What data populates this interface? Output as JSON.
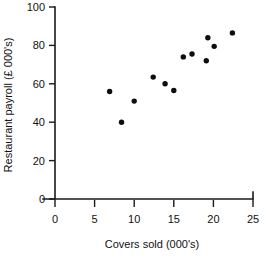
{
  "chart_data": {
    "type": "scatter",
    "title": "",
    "xlabel": "Covers sold (000's)",
    "ylabel": "Restaurant payroll (£ 000's)",
    "xlim": [
      0,
      25
    ],
    "ylim": [
      0,
      100
    ],
    "xticks": [
      0,
      5,
      10,
      15,
      20,
      25
    ],
    "yticks": [
      0,
      20,
      40,
      60,
      80,
      100
    ],
    "xtick_labels": [
      "0",
      "5",
      "10",
      "15",
      "20",
      "25"
    ],
    "ytick_labels": [
      "0",
      "20",
      "40",
      "60",
      "80",
      "100"
    ],
    "grid": false,
    "legend": false,
    "marker_color": "#0d0d0d",
    "axis_color": "#1a1a1a",
    "series": [
      {
        "name": "Restaurants",
        "points": [
          {
            "x": 6.9,
            "y": 56
          },
          {
            "x": 8.4,
            "y": 40
          },
          {
            "x": 10.0,
            "y": 51
          },
          {
            "x": 12.4,
            "y": 63.5
          },
          {
            "x": 13.9,
            "y": 60
          },
          {
            "x": 15.0,
            "y": 56.5
          },
          {
            "x": 16.2,
            "y": 74
          },
          {
            "x": 17.3,
            "y": 75.5
          },
          {
            "x": 19.1,
            "y": 72
          },
          {
            "x": 19.3,
            "y": 84
          },
          {
            "x": 20.1,
            "y": 79.5
          },
          {
            "x": 22.4,
            "y": 86.5
          }
        ]
      }
    ]
  }
}
